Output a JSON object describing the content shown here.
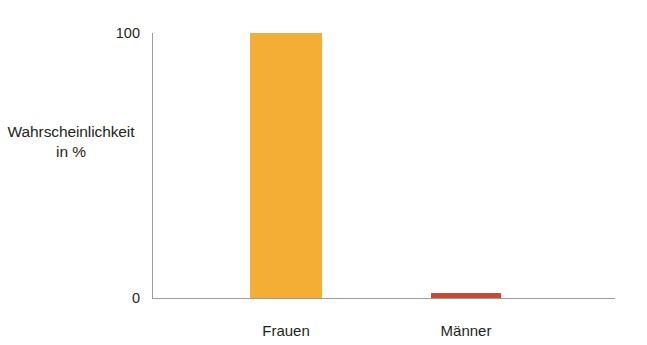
{
  "chart_data": {
    "type": "bar",
    "title": "",
    "xlabel": "",
    "ylabel": "Wahrscheinlichkeit in %",
    "ylabel_line1": "Wahrscheinlichkeit",
    "ylabel_line2": "in %",
    "categories": [
      "Frauen",
      "Männer"
    ],
    "values": [
      100,
      2
    ],
    "ylim": [
      0,
      100
    ],
    "ytick_labels": [
      "100",
      "0"
    ],
    "ytick_values": [
      100,
      0
    ],
    "grid": false,
    "legend": false,
    "bar_colors": [
      "#F5AE35",
      "#C94A33"
    ],
    "axis_color": "#9B9B9B",
    "background": "#FFFFFF",
    "text_color": "#231F20"
  }
}
